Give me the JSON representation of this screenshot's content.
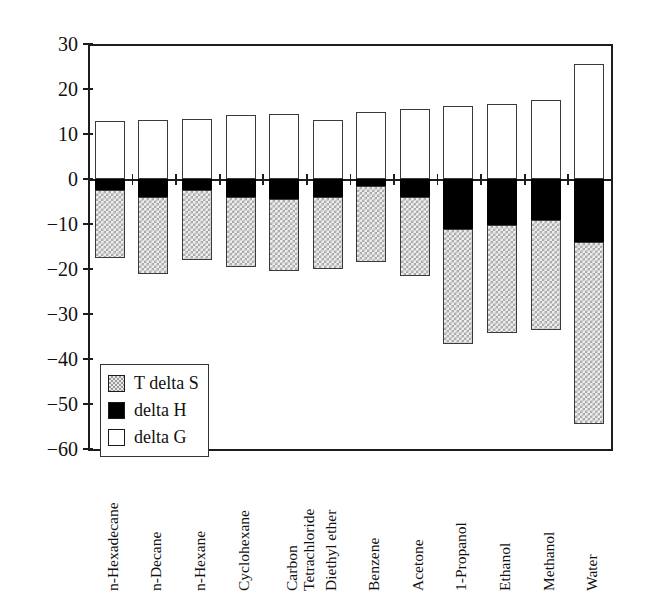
{
  "chart_data": {
    "type": "bar",
    "subtype": "stacked-signed",
    "title": "",
    "xlabel": "",
    "ylabel": "",
    "ylim": [
      -60,
      30
    ],
    "ytick_step": 10,
    "yticks": [
      "30",
      "20",
      "10",
      "0",
      "-10",
      "-20",
      "-30",
      "-40",
      "-50",
      "-60"
    ],
    "grid": false,
    "legend_position": "lower-left-inside",
    "categories": [
      "n-Hexadecane",
      "n-Decane",
      "n-Hexane",
      "Cyclohexane",
      "Carbon Tetrachloride",
      "Diethyl ether",
      "Benzene",
      "Acetone",
      "1-Propanol",
      "Ethanol",
      "Methanol",
      "Water"
    ],
    "category_lines": [
      [
        "n-Hexadecane"
      ],
      [
        "n-Decane"
      ],
      [
        "n-Hexane"
      ],
      [
        "Cyclohexane"
      ],
      [
        "Carbon",
        "Tetrachloride"
      ],
      [
        "Diethyl ether"
      ],
      [
        "Benzene"
      ],
      [
        "Acetone"
      ],
      [
        "1-Propanol"
      ],
      [
        "Ethanol"
      ],
      [
        "Methanol"
      ],
      [
        "Water"
      ]
    ],
    "series": [
      {
        "name": "T delta S",
        "key": "tds",
        "fill": "dotted-grey",
        "values": [
          -15.0,
          -17.0,
          -15.5,
          -15.5,
          -16.0,
          -16.0,
          -17.0,
          -17.5,
          -25.5,
          -24.0,
          -24.5,
          -40.5
        ]
      },
      {
        "name": "delta H",
        "key": "dh",
        "fill": "black",
        "values": [
          -2.5,
          -4.0,
          -2.5,
          -4.0,
          -4.5,
          -4.0,
          -1.5,
          -4.0,
          -11.2,
          -10.2,
          -9.0,
          -14.0
        ]
      },
      {
        "name": "delta G",
        "key": "dg",
        "fill": "white",
        "values": [
          13.0,
          13.2,
          13.3,
          14.3,
          14.5,
          13.2,
          15.0,
          15.6,
          16.2,
          16.6,
          17.6,
          25.6
        ]
      }
    ],
    "bar_negative_totals": [
      -17.5,
      -21.0,
      -18.0,
      -19.5,
      -20.5,
      -20.0,
      -18.5,
      -21.5,
      -36.7,
      -34.2,
      -33.5,
      -54.5
    ],
    "legend_entries": [
      {
        "label": "T delta S",
        "swatch": "dotted-grey"
      },
      {
        "label": "delta H",
        "swatch": "black"
      },
      {
        "label": "delta G",
        "swatch": "white"
      }
    ]
  }
}
